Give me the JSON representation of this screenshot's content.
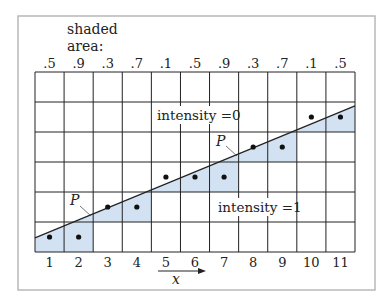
{
  "figure": {
    "header_label_line1": "shaded",
    "header_label_line2": "area:",
    "shaded_areas": [
      ".5",
      ".9",
      ".3",
      ".7",
      ".1",
      ".5",
      ".9",
      ".3",
      ".7",
      ".1",
      ".5"
    ],
    "x_ticks": [
      "1",
      "2",
      "3",
      "4",
      "5",
      "6",
      "7",
      "8",
      "9",
      "10",
      "11"
    ],
    "x_axis_label": "x",
    "region_above_label": "intensity =0",
    "region_below_label": "intensity =1",
    "point_label": "P",
    "grid": {
      "columns": 11,
      "rows": 6
    },
    "line": {
      "from": [
        0,
        0.47
      ],
      "to": [
        11,
        4.87
      ]
    },
    "pixel_rows": [
      1,
      1,
      2,
      2,
      3,
      3,
      3,
      4,
      4,
      5,
      5
    ],
    "colors": {
      "shade": "#d3e2f2",
      "grid": "#222222",
      "frame": "#b8b8b8",
      "text": "#222222"
    }
  }
}
